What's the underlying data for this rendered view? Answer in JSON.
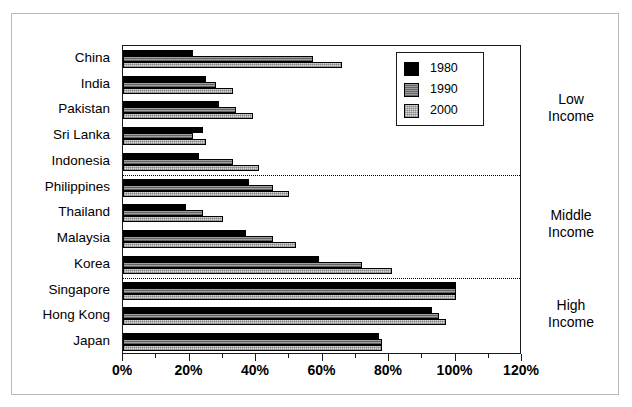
{
  "chart_data": {
    "type": "bar",
    "orientation": "horizontal",
    "title": "",
    "xlabel": "",
    "ylabel": "",
    "xlim": [
      0,
      120
    ],
    "xticks": [
      0,
      20,
      40,
      60,
      80,
      100,
      120
    ],
    "xticklabels": [
      "0%",
      "20%",
      "40%",
      "60%",
      "80%",
      "100%",
      "120%"
    ],
    "minor_tick_step": 10,
    "grid": false,
    "legend_position": "upper right",
    "categories": [
      "China",
      "India",
      "Pakistan",
      "Sri Lanka",
      "Indonesia",
      "Philippines",
      "Thailand",
      "Malaysia",
      "Korea",
      "Singapore",
      "Hong Kong",
      "Japan"
    ],
    "series": [
      {
        "name": "1980",
        "color": "#000000",
        "values": [
          21,
          25,
          29,
          24,
          23,
          38,
          19,
          37,
          59,
          100,
          93,
          77
        ]
      },
      {
        "name": "1990",
        "color": "#8c8c8c",
        "values": [
          57,
          28,
          34,
          21,
          33,
          45,
          24,
          45,
          72,
          100,
          95,
          78
        ]
      },
      {
        "name": "2000",
        "color": "#d6d6d6",
        "values": [
          66,
          33,
          39,
          25,
          41,
          50,
          30,
          52,
          81,
          100,
          97,
          78
        ]
      }
    ],
    "annotations": [
      {
        "label_line1": "Low",
        "label_line2": "Income",
        "group": "low-income",
        "categories": [
          "China",
          "India",
          "Pakistan",
          "Sri Lanka",
          "Indonesia"
        ]
      },
      {
        "label_line1": "Middle",
        "label_line2": "Income",
        "group": "middle-income",
        "categories": [
          "Philippines",
          "Thailand",
          "Malaysia",
          "Korea"
        ]
      },
      {
        "label_line1": "High",
        "label_line2": "Income",
        "group": "high-income",
        "categories": [
          "Singapore",
          "Hong Kong",
          "Japan"
        ]
      }
    ],
    "group_dividers_after": [
      "Indonesia",
      "Korea"
    ]
  },
  "legend": {
    "entries": [
      {
        "label": "1980"
      },
      {
        "label": "1990"
      },
      {
        "label": "2000"
      }
    ]
  }
}
